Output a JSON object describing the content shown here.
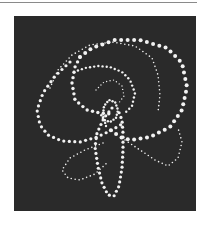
{
  "figure": {
    "background_color": "#2a2a2a",
    "dot_color": "#f2f2f2",
    "rule_color": "#8a8a8a",
    "curves": [
      {
        "name": "outer-arc-large",
        "radius": 2.0,
        "spacing": 6.5,
        "points": [
          [
            80,
            57
          ],
          [
            92,
            48
          ],
          [
            115,
            40
          ],
          [
            140,
            40
          ],
          [
            167,
            48
          ],
          [
            182,
            63
          ],
          [
            187,
            87
          ],
          [
            182,
            110
          ],
          [
            170,
            127
          ],
          [
            150,
            137
          ],
          [
            130,
            140
          ],
          [
            120,
            137
          ],
          [
            108,
            128
          ]
        ]
      },
      {
        "name": "left-inner-arc",
        "radius": 1.7,
        "spacing": 5.5,
        "points": [
          [
            80,
            57
          ],
          [
            75,
            67
          ],
          [
            72,
            83
          ],
          [
            75,
            100
          ],
          [
            87,
            110
          ],
          [
            100,
            113
          ],
          [
            112,
            114
          ]
        ]
      },
      {
        "name": "left-outer-loop",
        "radius": 1.6,
        "spacing": 5.5,
        "points": [
          [
            70,
            62
          ],
          [
            55,
            76
          ],
          [
            43,
            93
          ],
          [
            37,
            110
          ],
          [
            40,
            125
          ],
          [
            48,
            135
          ],
          [
            62,
            141
          ],
          [
            80,
            142
          ],
          [
            97,
            137
          ],
          [
            112,
            130
          ],
          [
            122,
            124
          ]
        ]
      },
      {
        "name": "inner-ring",
        "radius": 1.2,
        "spacing": 4.2,
        "points": [
          [
            74,
            72
          ],
          [
            85,
            68
          ],
          [
            98,
            66
          ],
          [
            110,
            67
          ],
          [
            122,
            72
          ],
          [
            130,
            80
          ],
          [
            135,
            93
          ],
          [
            132,
            106
          ],
          [
            124,
            114
          ]
        ]
      },
      {
        "name": "bottom-loop",
        "radius": 1.6,
        "spacing": 5,
        "points": [
          [
            112,
            108
          ],
          [
            104,
            118
          ],
          [
            97,
            133
          ],
          [
            95,
            147
          ],
          [
            98,
            167
          ],
          [
            102,
            183
          ],
          [
            108,
            195
          ],
          [
            114,
            196
          ],
          [
            119,
            186
          ],
          [
            122,
            168
          ],
          [
            123,
            150
          ],
          [
            123,
            133
          ],
          [
            122,
            120
          ],
          [
            118,
            110
          ]
        ]
      },
      {
        "name": "center-knot",
        "radius": 1.2,
        "spacing": 3.2,
        "points": [
          [
            106,
            126
          ],
          [
            103,
            115
          ],
          [
            104,
            106
          ],
          [
            109,
            100
          ],
          [
            115,
            102
          ],
          [
            118,
            110
          ],
          [
            116,
            118
          ],
          [
            110,
            122
          ],
          [
            104,
            120
          ],
          [
            100,
            113
          ]
        ]
      },
      {
        "name": "faint-upper-ring",
        "radius": 0.8,
        "spacing": 4,
        "points": [
          [
            50,
            88
          ],
          [
            58,
            70
          ],
          [
            72,
            55
          ],
          [
            90,
            45
          ],
          [
            112,
            42
          ],
          [
            135,
            46
          ],
          [
            152,
            58
          ],
          [
            158,
            75
          ],
          [
            160,
            95
          ],
          [
            158,
            112
          ]
        ]
      },
      {
        "name": "faint-lower-left-loop",
        "radius": 0.8,
        "spacing": 4,
        "points": [
          [
            103,
            143
          ],
          [
            85,
            150
          ],
          [
            70,
            158
          ],
          [
            62,
            170
          ],
          [
            68,
            178
          ],
          [
            80,
            180
          ],
          [
            95,
            174
          ],
          [
            108,
            162
          ]
        ]
      },
      {
        "name": "faint-lower-right-loop",
        "radius": 0.8,
        "spacing": 4,
        "points": [
          [
            125,
            140
          ],
          [
            140,
            150
          ],
          [
            155,
            160
          ],
          [
            168,
            166
          ],
          [
            178,
            158
          ],
          [
            182,
            142
          ],
          [
            178,
            128
          ]
        ]
      },
      {
        "name": "faint-inner-spiral",
        "radius": 0.7,
        "spacing": 3.5,
        "points": [
          [
            96,
            90
          ],
          [
            104,
            82
          ],
          [
            114,
            80
          ],
          [
            122,
            86
          ],
          [
            124,
            96
          ],
          [
            118,
            104
          ]
        ]
      }
    ]
  }
}
